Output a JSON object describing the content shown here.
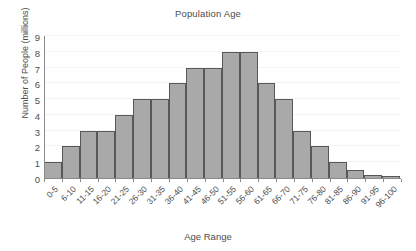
{
  "chart_data": {
    "type": "bar",
    "title": "Population Age",
    "xlabel": "Age Range",
    "ylabel": "Number of People (millions)",
    "categories": [
      "0-5",
      "6-10",
      "11-15",
      "16-20",
      "21-25",
      "26-30",
      "31-35",
      "36-40",
      "41-45",
      "46-50",
      "51-55",
      "56-60",
      "61-65",
      "66-70",
      "71-75",
      "76-80",
      "81-85",
      "86-90",
      "91-95",
      "96-100"
    ],
    "values": [
      1,
      2,
      3,
      3,
      4,
      5,
      5,
      6,
      7,
      7,
      8,
      8,
      6,
      5,
      3,
      2,
      1,
      0.5,
      0.2,
      0.1
    ],
    "ylim": [
      0,
      9
    ],
    "yticks": [
      0,
      1,
      2,
      3,
      4,
      5,
      6,
      7,
      8,
      9
    ],
    "grid": true,
    "legend": false,
    "colors": {
      "bar_fill": "#a9a9a9",
      "bar_edge": "#585858",
      "grid": "#f4f4f4",
      "axis": "#8a8a8a",
      "text": "#4d4d4d",
      "background": "#ffffff"
    }
  }
}
